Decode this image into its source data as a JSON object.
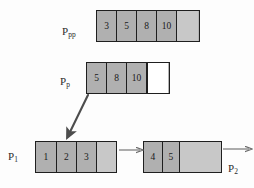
{
  "diagram": {
    "background_color": "#fdfdfd",
    "cell_fill": "#b0b0b0",
    "cell_empty_fill": "#c8c8c8",
    "cell_white_fill": "#ffffff",
    "border_color": "#1f1f1f",
    "arrow_color": "#4a4a4a",
    "rows": [
      {
        "label_main": "P",
        "label_sub": "pp",
        "label_name": "label-ppp",
        "cells": [
          {
            "value": "3",
            "kind": "filled"
          },
          {
            "value": "5",
            "kind": "filled"
          },
          {
            "value": "8",
            "kind": "filled"
          },
          {
            "value": "10",
            "kind": "filled"
          },
          {
            "value": "",
            "kind": "empty-light"
          }
        ]
      },
      {
        "label_main": "P",
        "label_sub": "p",
        "label_name": "label-pp",
        "cells": [
          {
            "value": "5",
            "kind": "filled"
          },
          {
            "value": "8",
            "kind": "filled"
          },
          {
            "value": "10",
            "kind": "filled"
          },
          {
            "value": "",
            "kind": "empty-white"
          }
        ]
      },
      {
        "label_main": "P",
        "label_sub": "1",
        "label_name": "label-p1",
        "cells": [
          {
            "value": "1",
            "kind": "filled"
          },
          {
            "value": "2",
            "kind": "filled"
          },
          {
            "value": "3",
            "kind": "filled"
          },
          {
            "value": "",
            "kind": "empty-light"
          }
        ]
      },
      {
        "label_main": "P",
        "label_sub": "2",
        "label_name": "label-p2",
        "cells": [
          {
            "value": "4",
            "kind": "filled"
          },
          {
            "value": "5",
            "kind": "filled"
          },
          {
            "value": "",
            "kind": "empty-light"
          }
        ]
      }
    ],
    "arrows": [
      {
        "name": "diagonal-insert-arrow",
        "from": "Pp first cell",
        "to": "P1 second cell",
        "style": "solid-thick"
      },
      {
        "name": "link-arrow-p1-to-p2",
        "from": "P1 right edge",
        "to": "P2 left edge",
        "style": "solid-thin"
      },
      {
        "name": "tail-arrow-p2",
        "from": "P2 right edge",
        "to": "outward",
        "style": "solid-thin"
      }
    ]
  }
}
